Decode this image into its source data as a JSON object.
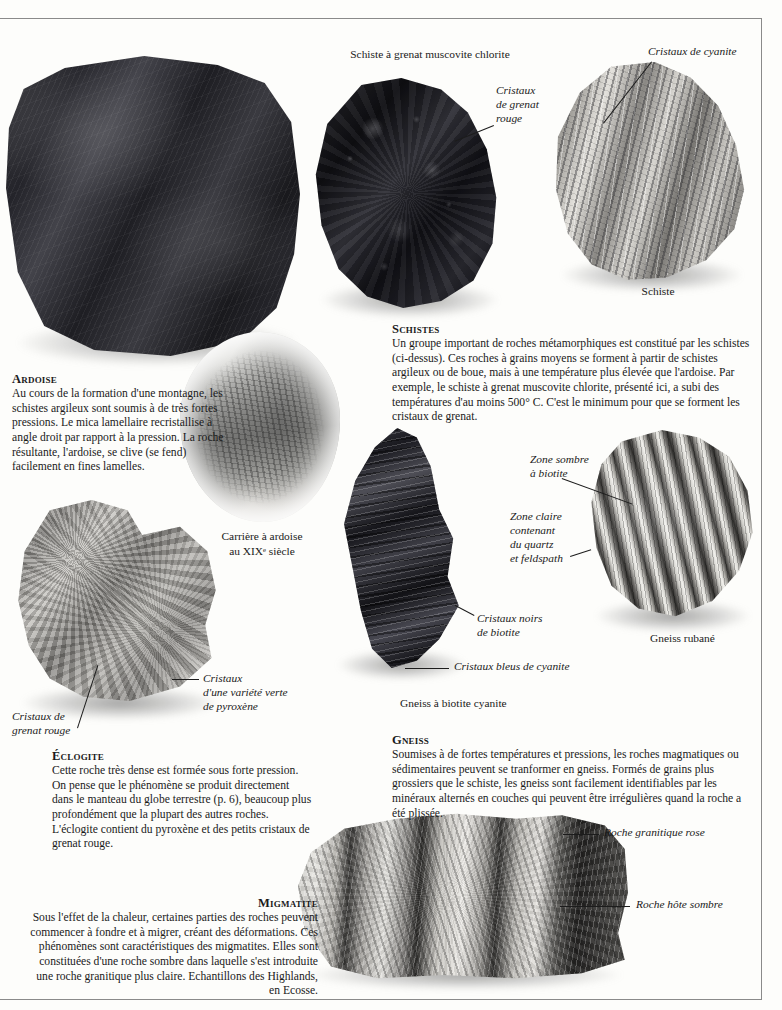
{
  "page": {
    "language": "fr",
    "subject": "Roches métamorphiques"
  },
  "captions": {
    "schiste_grenat_muscovite_chlorite": "Schiste à grenat muscovite chlorite",
    "schiste": "Schiste",
    "gneiss_rubane": "Gneiss rubané",
    "gneiss_biotite_cyanite": "Gneiss à biotite cyanite",
    "carriere_line1": "Carrière à ardoise",
    "carriere_line2": "au XIXᵉ siècle"
  },
  "labels": {
    "cristaux_de_cyanite": "Cristaux de cyanite",
    "cristaux_de_grenat_rouge_l1": "Cristaux",
    "cristaux_de_grenat_rouge_l2": "de grenat",
    "cristaux_de_grenat_rouge_l3": "rouge",
    "zone_sombre_l1": "Zone sombre",
    "zone_sombre_l2": "à biotite",
    "zone_claire_l1": "Zone claire",
    "zone_claire_l2": "contenant",
    "zone_claire_l3": "du quartz",
    "zone_claire_l4": "et feldspath",
    "cristaux_noirs_l1": "Cristaux noirs",
    "cristaux_noirs_l2": "de biotite",
    "cristaux_bleus_cyanite": "Cristaux bleus de cyanite",
    "cristaux_variete_verte_l1": "Cristaux",
    "cristaux_variete_verte_l2": "d'une variété verte",
    "cristaux_variete_verte_l3": "de pyroxène",
    "cristaux_grenat_rouge_eclogite_l1": "Cristaux de",
    "cristaux_grenat_rouge_eclogite_l2": "grenat rouge",
    "roche_granitique_rose": "Roche granitique rose",
    "roche_hote_sombre": "Roche hôte sombre"
  },
  "sections": {
    "ardoise": {
      "heading": "Ardoise",
      "body": "Au cours de la formation d'une montagne, les schistes argileux sont soumis à de très fortes pressions. Le mica lamellaire recristallise à angle droit par rapport à la pression. La roche résultante, l'ardoise, se clive (se fend) facilement en fines lamelles."
    },
    "schistes": {
      "heading": "Schistes",
      "body": "Un groupe important de roches métamorphiques est constitué par les schistes (ci-dessus). Ces roches à grains moyens se forment à partir de schistes argileux ou de boue, mais à une température plus élevée que l'ardoise. Par exemple, le schiste à grenat muscovite chlorite, présenté ici, a subi des températures d'au moins 500° C. C'est le minimum pour que se forment les cristaux de grenat."
    },
    "eclogite": {
      "heading": "Éclogite",
      "body": "Cette roche très dense est formée sous forte pression. On pense que le phénomène se produit directement dans le manteau du globe terrestre (p. 6), beaucoup plus profondément que la plupart des autres roches. L'éclogite contient du pyroxène et des petits cristaux de grenat rouge."
    },
    "gneiss": {
      "heading": "Gneiss",
      "body": "Soumises à de fortes températures et pressions, les roches magmatiques ou sédimentaires peuvent se tranformer en gneiss. Formés de grains plus grossiers que le schiste, les gneiss sont facilement identifiables par les minéraux alternés en couches qui peuvent être irrégulières quand la roche a été plissée."
    },
    "migmatite": {
      "heading": "Migmatite",
      "body": "Sous l'effet de la chaleur, certaines parties des roches peuvent commencer à fondre et à migrer, créant des déformations. Ces phénomènes sont caractéristiques des migmatites. Elles sont constituées d'une roche sombre dans laquelle s'est introduite une roche granitique plus claire. Echantillons des Highlands, en Ecosse."
    }
  },
  "colors": {
    "page_background": "#fdfdfb",
    "text": "#1a1a1a",
    "rule": "#8a8a8a"
  }
}
